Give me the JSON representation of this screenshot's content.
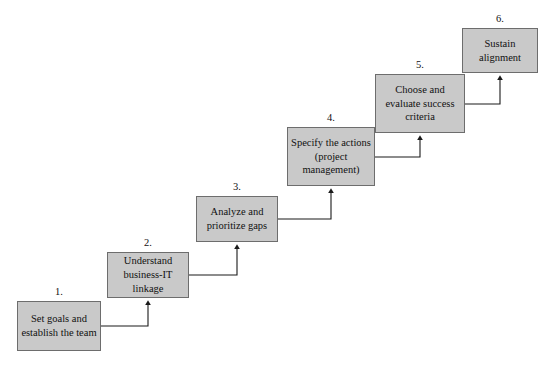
{
  "diagram": {
    "background_color": "#ffffff",
    "box_fill_color": "#c9c9c9",
    "box_border_color": "#6d6d6d",
    "connector_color": "#1a1a1a",
    "text_color": "#111111",
    "steps": [
      {
        "number": "1.",
        "text": "Set goals and establish the team",
        "x": 17,
        "y": 301,
        "w": 84,
        "h": 50
      },
      {
        "number": "2.",
        "text": "Understand business-IT linkage",
        "x": 107,
        "y": 252,
        "w": 82,
        "h": 46
      },
      {
        "number": "3.",
        "text": "Analyze and prioritize gaps",
        "x": 196,
        "y": 196,
        "w": 82,
        "h": 46
      },
      {
        "number": "4.",
        "text": "Specify the actions (project management)",
        "x": 287,
        "y": 127,
        "w": 88,
        "h": 59
      },
      {
        "number": "5.",
        "text": "Choose and evaluate success criteria",
        "x": 375,
        "y": 74,
        "w": 90,
        "h": 59
      },
      {
        "number": "6.",
        "text": "Sustain alignment",
        "x": 462,
        "y": 28,
        "w": 76,
        "h": 45
      }
    ],
    "connectors": [
      {
        "from": "1",
        "to": "2",
        "from_x": 101,
        "from_y": 326,
        "corner_x": 148,
        "to_y": 298
      },
      {
        "from": "2",
        "to": "3",
        "from_x": 189,
        "from_y": 275,
        "corner_x": 237,
        "to_y": 242
      },
      {
        "from": "3",
        "to": "4",
        "from_x": 278,
        "from_y": 219,
        "corner_x": 331,
        "to_y": 186
      },
      {
        "from": "4",
        "to": "5",
        "from_x": 375,
        "from_y": 157,
        "corner_x": 420,
        "to_y": 133
      },
      {
        "from": "5",
        "to": "6",
        "from_x": 465,
        "from_y": 104,
        "corner_x": 500,
        "to_y": 73
      }
    ]
  }
}
